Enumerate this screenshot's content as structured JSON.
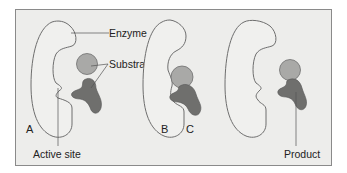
{
  "figure": {
    "panels": [
      {
        "id": "A",
        "label": "A"
      },
      {
        "id": "B",
        "label": "B"
      },
      {
        "id": "C",
        "label": "C"
      }
    ],
    "labels": {
      "enzyme": "Enzyme",
      "substrates": "Substrates",
      "active_site": "Active site",
      "product": "Product"
    },
    "colors": {
      "background": "#ededeb",
      "border": "#8a8a8a",
      "enzyme_fill": "#f0f0ee",
      "enzyme_stroke": "#6e6e6e",
      "substrate_light": "#a9a9a7",
      "substrate_dark": "#6f6f6d",
      "leader_line": "#555555"
    }
  }
}
